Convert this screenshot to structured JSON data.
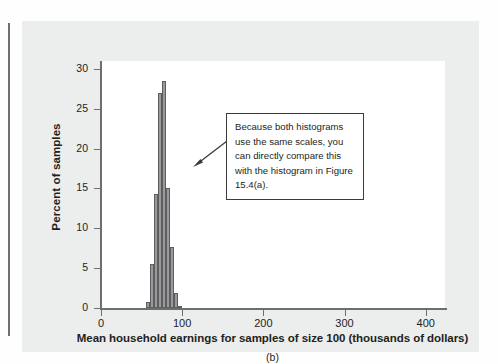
{
  "figure": {
    "sub_caption": "(b)",
    "annotation": {
      "text": "Because both histograms use the same scales, you can directly compare this with the histogram in Figure 15.4(a).",
      "arrow": "arrow-pointing-left-to-histogram"
    },
    "colors": {
      "bar_fill": "#9a9a9c",
      "bar_stroke": "#5d5e60",
      "panel_bg": "#eceded",
      "plot_bg": "#ffffff",
      "axis": "#6d6e70",
      "text": "#231f20"
    }
  },
  "chart_data": {
    "type": "bar",
    "title": "",
    "xlabel": "Mean household earnings for samples of size 100 (thousands of dollars)",
    "ylabel": "Percent of samples",
    "xlim": [
      0,
      425
    ],
    "ylim": [
      0,
      31
    ],
    "xticks": [
      0,
      100,
      200,
      300,
      400
    ],
    "xtick_labels": [
      "0",
      "100",
      "200",
      "300",
      "400"
    ],
    "yticks": [
      0,
      5,
      10,
      15,
      20,
      25,
      30
    ],
    "ytick_labels": [
      "0",
      "5",
      "10",
      "15",
      "20",
      "25",
      "30"
    ],
    "grid": false,
    "legend": "none",
    "bin_width": 5,
    "bins": [
      {
        "x_left": 55,
        "x_right": 60,
        "value": 0.8
      },
      {
        "x_left": 60,
        "x_right": 65,
        "value": 5.5
      },
      {
        "x_left": 65,
        "x_right": 70,
        "value": 14.3
      },
      {
        "x_left": 70,
        "x_right": 75,
        "value": 27.0
      },
      {
        "x_left": 75,
        "x_right": 80,
        "value": 28.5
      },
      {
        "x_left": 80,
        "x_right": 85,
        "value": 15.0
      },
      {
        "x_left": 85,
        "x_right": 90,
        "value": 7.7
      },
      {
        "x_left": 90,
        "x_right": 95,
        "value": 1.9
      },
      {
        "x_left": 95,
        "x_right": 100,
        "value": 0.3
      }
    ],
    "categories": [
      "55-60",
      "60-65",
      "65-70",
      "70-75",
      "75-80",
      "80-85",
      "85-90",
      "90-95",
      "95-100"
    ],
    "values": [
      0.8,
      5.5,
      14.3,
      27.0,
      28.5,
      15.0,
      7.7,
      1.9,
      0.3
    ]
  }
}
